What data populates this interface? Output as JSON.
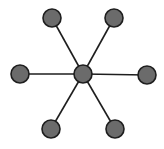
{
  "diagram": {
    "type": "star-graph",
    "colors": {
      "background": "#ffffff",
      "node_fill": "#6b6b6b",
      "node_stroke": "#1e1e1e",
      "edge": "#1e1e1e"
    },
    "node_radius": 9,
    "center": {
      "id": "hub",
      "x": 83,
      "y": 74
    },
    "nodes": [
      {
        "id": "top-left",
        "x": 52,
        "y": 18
      },
      {
        "id": "top-right",
        "x": 114,
        "y": 18
      },
      {
        "id": "left",
        "x": 20,
        "y": 74
      },
      {
        "id": "right",
        "x": 147,
        "y": 75
      },
      {
        "id": "bottom-left",
        "x": 51,
        "y": 129
      },
      {
        "id": "bottom-right",
        "x": 115,
        "y": 129
      }
    ]
  }
}
